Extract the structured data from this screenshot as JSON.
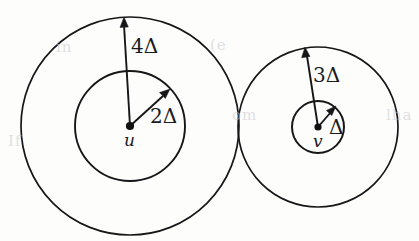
{
  "figure": {
    "kind": "two-tangent-concentric-circle-pairs-diagram",
    "background_color": "#fdfdfc",
    "stroke_color": "#17171a",
    "nodes": [
      {
        "id": "u",
        "label": "u",
        "center": {
          "x": 130,
          "y": 126
        },
        "inner_radius_px": 55,
        "outer_radius_px": 109,
        "inner_label": "2Δ",
        "outer_label": "4Δ"
      },
      {
        "id": "v",
        "label": "v",
        "center": {
          "x": 318,
          "y": 127
        },
        "inner_radius_px": 26,
        "outer_radius_px": 80,
        "inner_label": "Δ",
        "outer_label": "3Δ"
      }
    ],
    "labels": {
      "u_outer": "4Δ",
      "u_inner": "2Δ",
      "u_node": "u",
      "v_outer": "3Δ",
      "v_inner": "Δ",
      "v_node": "v"
    },
    "ghost_text": {
      "line1": "in",
      "line2": "(e",
      "line3": "om",
      "line4": "If",
      "line5": "lha"
    }
  }
}
